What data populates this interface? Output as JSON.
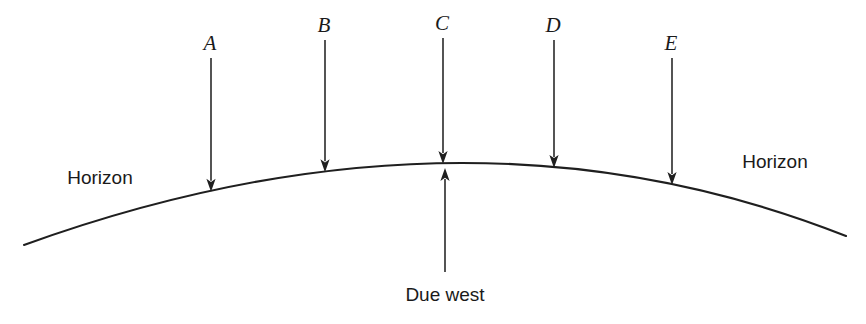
{
  "diagram": {
    "background_color": "#ffffff",
    "line_color": "#1f1f1f",
    "width": 866,
    "height": 324,
    "horizon": {
      "left_label": "Horizon",
      "right_label": "Horizon",
      "left_label_x": 100,
      "left_label_y": 184,
      "right_label_x": 775,
      "right_label_y": 168,
      "curve_start_x": 24,
      "curve_start_y": 245,
      "curve_apex_x": 450,
      "curve_apex_y": 163,
      "curve_end_x": 846,
      "curve_end_y": 236
    },
    "due_west": {
      "label": "Due west",
      "label_x": 445,
      "label_y": 301,
      "arrow_x": 445,
      "arrow_tail_y": 272,
      "arrow_tip_y": 168,
      "direction": "up"
    },
    "markers": [
      {
        "label": "A",
        "x": 211,
        "label_y": 50,
        "shaft_top_y": 58,
        "tip_y": 186,
        "direction": "down"
      },
      {
        "label": "B",
        "x": 325,
        "label_y": 32,
        "shaft_top_y": 40,
        "tip_y": 167,
        "direction": "down"
      },
      {
        "label": "C",
        "x": 443,
        "label_y": 30,
        "shaft_top_y": 38,
        "tip_y": 164,
        "direction": "down"
      },
      {
        "label": "D",
        "x": 554,
        "label_y": 32,
        "shaft_top_y": 40,
        "tip_y": 166,
        "direction": "down"
      },
      {
        "label": "E",
        "x": 672,
        "label_y": 50,
        "shaft_top_y": 58,
        "tip_y": 178,
        "direction": "down"
      }
    ]
  }
}
